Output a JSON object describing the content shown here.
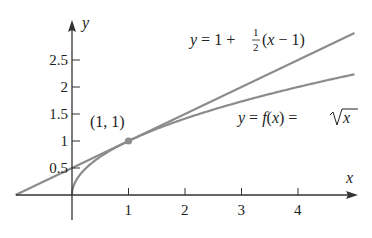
{
  "chart_data": {
    "type": "line",
    "title": "",
    "xlabel": "x",
    "ylabel": "y",
    "xlim": [
      -1,
      5
    ],
    "ylim": [
      0,
      3
    ],
    "x_ticks": [
      1,
      2,
      3,
      4
    ],
    "x_tick_labels": [
      "1",
      "2",
      "3",
      "4"
    ],
    "y_ticks": [
      0.5,
      1,
      1.5,
      2,
      2.5
    ],
    "y_tick_labels": [
      "0.5",
      "1",
      "1.5",
      "2",
      "2.5"
    ],
    "grid": false,
    "legend": null,
    "series": [
      {
        "name": "y = f(x) = √x",
        "kind": "curve",
        "color": "#8c8c8c",
        "x": [
          0,
          0.05,
          0.1,
          0.25,
          0.5,
          1,
          1.5,
          2,
          2.5,
          3,
          3.5,
          4,
          4.5,
          5
        ],
        "values": [
          0,
          0.224,
          0.316,
          0.5,
          0.707,
          1,
          1.225,
          1.414,
          1.581,
          1.732,
          1.871,
          2,
          2.121,
          2.236
        ]
      },
      {
        "name": "y = 1 + ½(x − 1)",
        "kind": "tangent-line",
        "color": "#8c8c8c",
        "x": [
          -1,
          0,
          1,
          2,
          3,
          4,
          5
        ],
        "values": [
          0,
          0.5,
          1,
          1.5,
          2,
          2.5,
          3
        ]
      }
    ],
    "annotations": [
      {
        "text": "(1, 1)",
        "x": 1,
        "y": 1,
        "marker": "point"
      },
      {
        "text": "y = 1 + ½(x − 1)",
        "target": "tangent-line"
      },
      {
        "text": "y = f(x) = √x",
        "target": "curve"
      }
    ]
  },
  "labels": {
    "x_axis": "x",
    "y_axis": "y",
    "point": "(1, 1)",
    "tangent_eq_lhs": "y = 1 + ",
    "tangent_eq_num": "1",
    "tangent_eq_den": "2",
    "tangent_eq_rest": "(x − 1)",
    "curve_eq_lhs": "y = f(x) = ",
    "curve_eq_rad": "x"
  },
  "colors": {
    "axis": "#333333",
    "curve": "#8c8c8c",
    "point": "#8c8c8c",
    "text": "#222222"
  }
}
